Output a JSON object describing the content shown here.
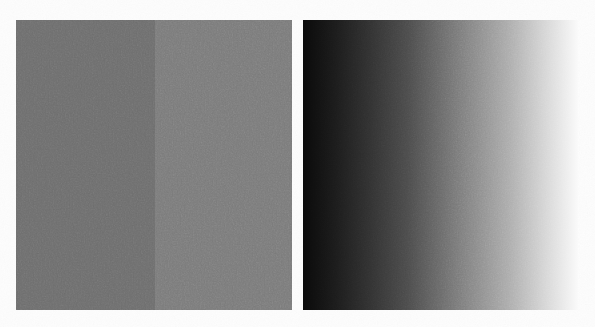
{
  "figure": {
    "background_color": "#fdfdfd",
    "width": 595,
    "height": 327,
    "medium": "scanned halftone print",
    "grain_visible": true
  },
  "panels": [
    {
      "id": "step-panel",
      "name": "uniform-step-pattern",
      "kind": "step",
      "description": "Two adjoining uniform gray fields of slightly different luminance",
      "x": 16,
      "y": 20,
      "width": 276,
      "height": 290,
      "blocks": [
        {
          "label": "left-step",
          "color": "#6e6e6e",
          "luminance_percent": 43,
          "width_fraction": 0.503
        },
        {
          "label": "right-step",
          "color": "#7b7b7b",
          "luminance_percent": 48,
          "width_fraction": 0.497
        }
      ],
      "boundary_x": 155
    },
    {
      "id": "ramp-panel",
      "name": "continuous-luminance-ramp",
      "kind": "gradient",
      "description": "Continuous horizontal gradient from near-black at left to near-white at right",
      "x": 303,
      "y": 20,
      "width": 275,
      "height": 290,
      "direction": "left-to-right",
      "start_color": "#0a0a0a",
      "end_color": "#fafafa",
      "start_luminance_percent": 4,
      "end_luminance_percent": 98,
      "stops": [
        {
          "position_percent": 0,
          "color": "#0a0a0a"
        },
        {
          "position_percent": 12,
          "color": "#1c1c1c"
        },
        {
          "position_percent": 25,
          "color": "#333333"
        },
        {
          "position_percent": 38,
          "color": "#4c4c4c"
        },
        {
          "position_percent": 50,
          "color": "#6b6b6b"
        },
        {
          "position_percent": 62,
          "color": "#8a8a8a"
        },
        {
          "position_percent": 75,
          "color": "#adadad"
        },
        {
          "position_percent": 88,
          "color": "#d6d6d6"
        },
        {
          "position_percent": 100,
          "color": "#fafafa"
        }
      ]
    }
  ],
  "chart_data": {
    "type": "heatmap",
    "xlabel": "",
    "ylabel": "",
    "grid": false,
    "legend_position": "none",
    "series": [
      {
        "name": "uniform-step-pattern",
        "profile_type": "step",
        "x": [
          0,
          25,
          50,
          50,
          75,
          100
        ],
        "values": [
          43,
          43,
          43,
          48,
          48,
          48
        ],
        "units": "percent luminance"
      },
      {
        "name": "continuous-luminance-ramp",
        "profile_type": "linear-ramp",
        "x": [
          0,
          12,
          25,
          38,
          50,
          62,
          75,
          88,
          100
        ],
        "values": [
          4,
          11,
          20,
          30,
          42,
          54,
          68,
          84,
          98
        ],
        "units": "percent luminance"
      }
    ],
    "xlim": [
      0,
      100
    ],
    "ylim": [
      0,
      100
    ]
  }
}
